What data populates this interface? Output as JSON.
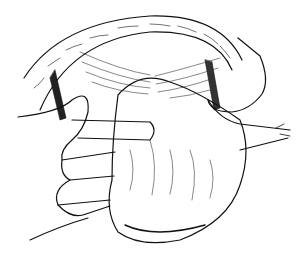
{
  "image": {
    "kind": "line-drawing",
    "subject": "surgical illustration: hands retracting tissue over an opened cavity",
    "colors": {
      "background": "#ffffff",
      "ink": "#111111"
    }
  }
}
